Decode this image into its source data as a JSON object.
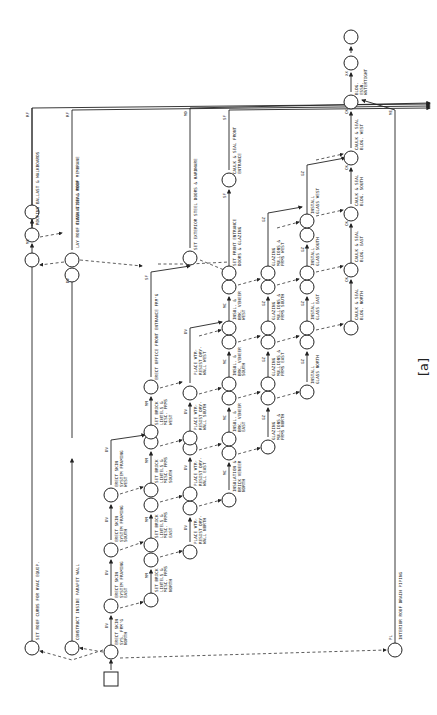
{
  "figure_label": "[a]",
  "orientation": "rotated 90 degrees counter-clockwise",
  "activities": {
    "roof_curbs": {
      "code": "ME",
      "label": "SET ROOF CURBS FOR HVAC EQUIP."
    },
    "parapet": {
      "code": "",
      "label": "CONSTRUCT INSIDE PARAPET WALL"
    },
    "roof_insulation": {
      "code": "DV",
      "label": "LAY ROOF INSULATION & ROOF MEMBRANE"
    },
    "flash_seal": {
      "code": "RF",
      "label": "FLASH & SEAL ROOF"
    },
    "roof_ballast": {
      "code": "RF",
      "label": "ROOFING BALLAST & WALKBOARDS"
    },
    "skin_north": {
      "code": "DV",
      "label1": "ERECT SKIN",
      "label2": "SYS. FRM'G",
      "label3": "NORTH"
    },
    "skin_east": {
      "code": "DV",
      "label1": "ERECT SKIN",
      "label2": "SYSTEM FRAMING",
      "label3": "EAST"
    },
    "skin_south": {
      "code": "DV",
      "label1": "ERECT SKIN",
      "label2": "SYSTEM FRAMING",
      "label3": "SOUTH"
    },
    "skin_west": {
      "code": "DV",
      "label1": "ERECT SKIN",
      "label2": "SYSTEM FRAMING",
      "label3": "WEST"
    },
    "brick_north": {
      "code": "MM",
      "label1": "SET BRICK",
      "label2": "LINTELS &",
      "label3": "MISC. FRMS",
      "label4": "NORTH"
    },
    "brick_east": {
      "code": "MM",
      "label1": "SET BRICK",
      "label2": "LINTELS &",
      "label3": "MISC. FRMS",
      "label4": "EAST"
    },
    "brick_south": {
      "code": "MM",
      "label1": "SET BRICK",
      "label2": "LINTELS &",
      "label3": "MISC. FRMS",
      "label4": "SOUTH"
    },
    "brick_west": {
      "code": "MM",
      "label1": "SET BRICK",
      "label2": "LINTELS &",
      "label3": "MISC. FRMS",
      "label4": "WEST"
    },
    "office_entrance": {
      "code": "SF",
      "label": "ERECT OFFICE FRONT ENTRANCE FRM'G"
    },
    "drywall_north": {
      "code": "DV",
      "label1": "PLACE WTR-",
      "label2": "RESIST DRY-",
      "label3": "WALL NORTH"
    },
    "drywall_east": {
      "code": "DV",
      "label1": "PLACE WTR-",
      "label2": "RESIST DRY-",
      "label3": "WALL EAST"
    },
    "drywall_south": {
      "code": "DV",
      "label1": "PLACE WTR-",
      "label2": "RESIST DRY-",
      "label3": "WALL SOUTH"
    },
    "drywall_west": {
      "code": "DV",
      "label1": "PLACE WTR-",
      "label2": "RESIST DRY-",
      "label3": "WALL WEST"
    },
    "veneer_north": {
      "code": "MC",
      "label1": "INSULATION &",
      "label2": "BRICK VENEER",
      "label3": "NORTH"
    },
    "veneer_east": {
      "code": "MC",
      "label1": "INSUL. &",
      "label2": "BRK. VENEER",
      "label3": "EAST"
    },
    "veneer_south": {
      "code": "MC",
      "label1": "INSUL. &",
      "label2": "BRK. VENEER",
      "label3": "SOUTH"
    },
    "veneer_west": {
      "code": "MC",
      "label1": "INSUL. &",
      "label2": "BRK. VENEER",
      "label3": "WEST"
    },
    "steel_doors": {
      "code": "MD",
      "label": "SET EXTERIOR STEEL DOORS & HARDWARE"
    },
    "front_entrance_doors": {
      "code": "SF",
      "label1": "SET FRONT ENTRANCE",
      "label2": "DOORS & GLAZING"
    },
    "caulk_front": {
      "code": "SF",
      "label1": "CAULK & SEAL FRONT",
      "label2": "ENTRANCE"
    },
    "glazing_north": {
      "code": "GZ",
      "label1": "GLAZING",
      "label2": "MULLIONS &",
      "label3": "FRMS NORTH"
    },
    "glazing_east": {
      "code": "GZ",
      "label1": "GLAZING",
      "label2": "MULLIONS &",
      "label3": "FRMS EAST"
    },
    "glazing_south": {
      "code": "GZ",
      "label1": "GLAZING",
      "label2": "MULLIONS &",
      "label3": "FRMS SOUTH"
    },
    "glazing_west": {
      "code": "GZ",
      "label1": "GLAZING",
      "label2": "MULLIONS &",
      "label3": "FRMS WEST"
    },
    "glass_north": {
      "code": "GZ",
      "label1": "INSTALL",
      "label2": "GLASS NORTH"
    },
    "glass_east": {
      "code": "GZ",
      "label1": "INSTALL",
      "label2": "GLASS EAST"
    },
    "glass_south": {
      "code": "GZ",
      "label1": "INSTALL",
      "label2": "GLASS SOUTH"
    },
    "glass_west": {
      "code": "GZ",
      "label1": "INSTALL",
      "label2": "GLASS WEST"
    },
    "caulk_north": {
      "code": "CK",
      "label1": "CAULK & SEAL",
      "label2": "BLDG. NORTH"
    },
    "caulk_east": {
      "code": "CK",
      "label1": "CAULK & SEAL",
      "label2": "BLDG. EAST"
    },
    "caulk_south": {
      "code": "CK",
      "label1": "CAULK & SEAL",
      "label2": "BLDG. SOUTH"
    },
    "caulk_west": {
      "code": "CK",
      "label1": "CAULK & SEAL",
      "label2": "BLDG. WEST"
    },
    "watertight": {
      "code": "XX",
      "label1": "BLDG.",
      "label2": "ESSN.",
      "label3": "WATERTIGHT"
    },
    "roof_drain": {
      "code": "PL",
      "label": "INTERIOR ROOF DRAIN PIPING"
    },
    "me_return": {
      "code": "ME"
    }
  }
}
